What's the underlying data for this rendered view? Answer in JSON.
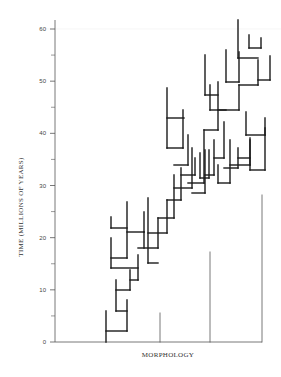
{
  "figure": {
    "y_axis_label": "TIME (MILLIONS OF YEARS)",
    "x_axis_label": "MORPHOLOGY",
    "y_ticks": [
      {
        "value": 0,
        "label": "0"
      },
      {
        "value": 10,
        "label": "10"
      },
      {
        "value": 20,
        "label": "20"
      },
      {
        "value": 30,
        "label": "30"
      },
      {
        "value": 40,
        "label": "40"
      },
      {
        "value": 50,
        "label": "50"
      },
      {
        "value": 60,
        "label": "60"
      }
    ],
    "y_range": [
      0,
      60
    ],
    "colors": {
      "branch": "#1a1a1a",
      "lineage": "#555555",
      "axis": "#555555"
    }
  },
  "tree": {
    "thick_segments": [
      [
        106,
        342,
        106,
        311
      ],
      [
        106,
        331,
        127,
        331
      ],
      [
        127,
        331,
        127,
        300
      ],
      [
        116,
        311,
        127,
        311
      ],
      [
        116,
        311,
        116,
        280
      ],
      [
        116,
        290,
        130,
        290
      ],
      [
        130,
        290,
        130,
        270
      ],
      [
        130,
        280,
        138,
        280
      ],
      [
        138,
        280,
        138,
        255
      ],
      [
        111,
        268,
        138,
        268
      ],
      [
        111,
        268,
        111,
        238
      ],
      [
        111,
        258,
        127,
        258
      ],
      [
        127,
        258,
        127,
        202
      ],
      [
        111,
        228,
        127,
        228
      ],
      [
        111,
        228,
        111,
        217
      ],
      [
        127,
        232,
        144,
        232
      ],
      [
        144,
        232,
        144,
        212
      ],
      [
        144,
        248,
        144,
        232
      ],
      [
        138,
        248,
        158,
        248
      ],
      [
        158,
        248,
        158,
        218
      ],
      [
        148,
        263,
        158,
        263
      ],
      [
        148,
        263,
        148,
        198
      ],
      [
        148,
        233,
        167,
        233
      ],
      [
        167,
        233,
        167,
        200
      ],
      [
        158,
        218,
        174,
        218
      ],
      [
        174,
        218,
        174,
        175
      ],
      [
        167,
        200,
        181,
        200
      ],
      [
        181,
        200,
        181,
        168
      ],
      [
        174,
        188,
        192,
        188
      ],
      [
        192,
        188,
        192,
        148
      ],
      [
        181,
        175,
        195,
        175
      ],
      [
        195,
        175,
        195,
        158
      ],
      [
        167,
        148,
        183,
        148
      ],
      [
        183,
        148,
        183,
        110
      ],
      [
        167,
        148,
        167,
        88
      ],
      [
        167,
        118,
        184,
        118
      ],
      [
        174,
        165,
        188,
        165
      ],
      [
        188,
        165,
        188,
        135
      ],
      [
        192,
        193,
        205,
        193
      ],
      [
        205,
        193,
        205,
        150
      ],
      [
        188,
        183,
        204,
        183
      ],
      [
        204,
        183,
        204,
        130
      ],
      [
        200,
        178,
        209,
        178
      ],
      [
        200,
        178,
        200,
        153
      ],
      [
        209,
        178,
        209,
        150
      ],
      [
        205,
        175,
        214,
        175
      ],
      [
        214,
        175,
        214,
        140
      ],
      [
        214,
        158,
        224,
        158
      ],
      [
        224,
        158,
        224,
        122
      ],
      [
        218,
        183,
        230,
        183
      ],
      [
        218,
        183,
        218,
        165
      ],
      [
        230,
        183,
        230,
        140
      ],
      [
        224,
        168,
        238,
        168
      ],
      [
        238,
        168,
        238,
        148
      ],
      [
        230,
        165,
        250,
        165
      ],
      [
        250,
        165,
        250,
        140
      ],
      [
        238,
        158,
        250,
        158
      ],
      [
        250,
        170,
        265,
        170
      ],
      [
        250,
        170,
        250,
        138
      ],
      [
        265,
        170,
        265,
        128
      ],
      [
        246,
        135,
        265,
        135
      ],
      [
        246,
        135,
        246,
        112
      ],
      [
        265,
        135,
        265,
        118
      ],
      [
        204,
        130,
        218,
        130
      ],
      [
        218,
        130,
        218,
        82
      ],
      [
        205,
        95,
        218,
        95
      ],
      [
        205,
        95,
        205,
        55
      ],
      [
        218,
        110,
        239,
        110
      ],
      [
        239,
        110,
        239,
        85
      ],
      [
        226,
        82,
        239,
        82
      ],
      [
        226,
        82,
        226,
        50
      ],
      [
        239,
        82,
        239,
        52
      ],
      [
        239,
        85,
        258,
        85
      ],
      [
        258,
        85,
        258,
        60
      ],
      [
        238,
        58,
        258,
        58
      ],
      [
        238,
        58,
        238,
        20
      ],
      [
        249,
        48,
        261,
        48
      ],
      [
        249,
        48,
        249,
        35
      ],
      [
        261,
        48,
        261,
        38
      ],
      [
        258,
        80,
        270,
        80
      ],
      [
        270,
        80,
        270,
        56
      ],
      [
        210,
        110,
        226,
        110
      ],
      [
        210,
        110,
        210,
        85
      ]
    ],
    "thin_lineages": [
      [
        160,
        342,
        160,
        313
      ],
      [
        210,
        342,
        210,
        252
      ],
      [
        262,
        342,
        262,
        195
      ]
    ]
  }
}
